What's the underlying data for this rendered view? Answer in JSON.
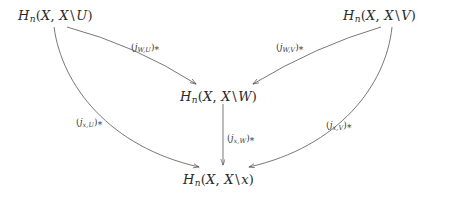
{
  "diagram": {
    "type": "commutative-diagram",
    "background_color": "#ffffff",
    "stroke_color": "#555555",
    "text_color": "#2a2a2a",
    "width": 449,
    "height": 198,
    "nodes": [
      {
        "id": "top-left",
        "label": "H_n(X, X \\ U)",
        "head": "H",
        "degree": "n",
        "open": "(",
        "space": "X",
        "comma": ",",
        "space2": "X",
        "setminus": "\\",
        "subspace": "U",
        "close": ")",
        "x": 18,
        "y": 8
      },
      {
        "id": "top-right",
        "label": "H_n(X, X \\ V)",
        "head": "H",
        "degree": "n",
        "open": "(",
        "space": "X",
        "comma": ",",
        "space2": "X",
        "setminus": "\\",
        "subspace": "V",
        "close": ")",
        "x": 343,
        "y": 8
      },
      {
        "id": "center",
        "label": "H_n(X, X \\ W)",
        "head": "H",
        "degree": "n",
        "open": "(",
        "space": "X",
        "comma": ",",
        "space2": "X",
        "setminus": "\\",
        "subspace": "W",
        "close": ")",
        "x": 180,
        "y": 89
      },
      {
        "id": "bottom",
        "label": "H_n(X, X \\ x)",
        "head": "H",
        "degree": "n",
        "open": "(",
        "space": "X",
        "comma": ",",
        "space2": "X",
        "setminus": "\\",
        "subspace": "x",
        "close": ")",
        "x": 183,
        "y": 172
      }
    ],
    "edges": [
      {
        "id": "u-to-w",
        "from": "top-left",
        "to": "center",
        "shape": "straight",
        "label": {
          "open": "(",
          "j": "j",
          "sub": "W,U",
          "close": ")",
          "star": "*",
          "x": 131,
          "y": 42
        }
      },
      {
        "id": "v-to-w",
        "from": "top-right",
        "to": "center",
        "shape": "straight",
        "label": {
          "open": "(",
          "j": "j",
          "sub": "W,V",
          "close": ")",
          "star": "*",
          "x": 276,
          "y": 42
        }
      },
      {
        "id": "w-to-x",
        "from": "center",
        "to": "bottom",
        "shape": "straight-vertical",
        "label": {
          "open": "(",
          "j": "j",
          "sub": "x,W",
          "close": ")",
          "star": "*",
          "x": 227,
          "y": 133
        }
      },
      {
        "id": "u-to-x",
        "from": "top-left",
        "to": "bottom",
        "shape": "curved",
        "label": {
          "open": "(",
          "j": "j",
          "sub": "x,U",
          "close": ")",
          "star": "*",
          "x": 76,
          "y": 117
        }
      },
      {
        "id": "v-to-x",
        "from": "top-right",
        "to": "bottom",
        "shape": "curved",
        "label": {
          "open": "(",
          "j": "j",
          "sub": "x,V",
          "close": ")",
          "star": "*",
          "x": 326,
          "y": 120
        }
      }
    ]
  }
}
